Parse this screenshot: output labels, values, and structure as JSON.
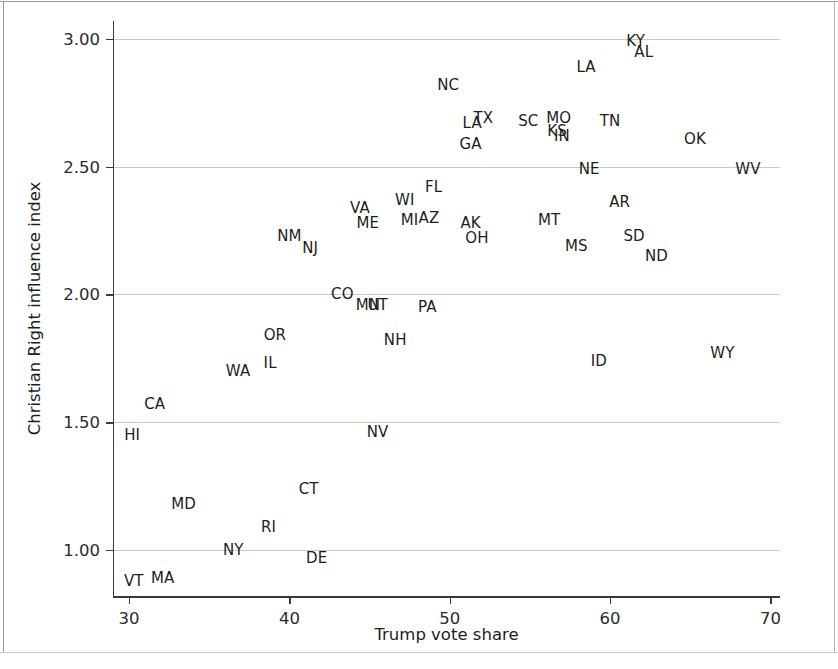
{
  "chart_data": {
    "type": "scatter",
    "title": "",
    "xlabel": "Trump vote share",
    "ylabel": "Christian Right influence index",
    "xlim": [
      29.0,
      70.6
    ],
    "ylim": [
      0.82,
      3.07
    ],
    "xticks": [
      30,
      40,
      50,
      60,
      70
    ],
    "xtick_labels": [
      "30",
      "40",
      "50",
      "60",
      "70"
    ],
    "yticks": [
      1.0,
      1.5,
      2.0,
      2.5,
      3.0
    ],
    "ytick_labels": [
      "1.00",
      "1.50",
      "2.00",
      "2.50",
      "3.00"
    ],
    "grid": "horizontal",
    "legend": "none",
    "marker": "text-label",
    "point_label_field": "state",
    "points": [
      {
        "state": "KY",
        "x": 61.6,
        "y": 2.99
      },
      {
        "state": "AL",
        "x": 62.1,
        "y": 2.95
      },
      {
        "state": "LA",
        "x": 58.5,
        "y": 2.89
      },
      {
        "state": "NC",
        "x": 49.9,
        "y": 2.82
      },
      {
        "state": "LA",
        "x": 51.4,
        "y": 2.67
      },
      {
        "state": "TX",
        "x": 52.1,
        "y": 2.69
      },
      {
        "state": "SC",
        "x": 54.9,
        "y": 2.68
      },
      {
        "state": "MO",
        "x": 56.8,
        "y": 2.69
      },
      {
        "state": "TN",
        "x": 60.0,
        "y": 2.68
      },
      {
        "state": "KS",
        "x": 56.7,
        "y": 2.64
      },
      {
        "state": "IN",
        "x": 57.0,
        "y": 2.62
      },
      {
        "state": "GA",
        "x": 51.3,
        "y": 2.59
      },
      {
        "state": "OK",
        "x": 65.3,
        "y": 2.61
      },
      {
        "state": "NE",
        "x": 58.7,
        "y": 2.49
      },
      {
        "state": "WV",
        "x": 68.6,
        "y": 2.49
      },
      {
        "state": "FL",
        "x": 49.0,
        "y": 2.42
      },
      {
        "state": "WI",
        "x": 47.2,
        "y": 2.37
      },
      {
        "state": "VA",
        "x": 44.4,
        "y": 2.34
      },
      {
        "state": "AR",
        "x": 60.6,
        "y": 2.36
      },
      {
        "state": "ME",
        "x": 44.9,
        "y": 2.28
      },
      {
        "state": "MI",
        "x": 47.5,
        "y": 2.29
      },
      {
        "state": "AZ",
        "x": 48.7,
        "y": 2.3
      },
      {
        "state": "AK",
        "x": 51.3,
        "y": 2.28
      },
      {
        "state": "MT",
        "x": 56.2,
        "y": 2.29
      },
      {
        "state": "OH",
        "x": 51.7,
        "y": 2.22
      },
      {
        "state": "SD",
        "x": 61.5,
        "y": 2.23
      },
      {
        "state": "NM",
        "x": 40.0,
        "y": 2.23
      },
      {
        "state": "MS",
        "x": 57.9,
        "y": 2.19
      },
      {
        "state": "NJ",
        "x": 41.3,
        "y": 2.18
      },
      {
        "state": "ND",
        "x": 62.9,
        "y": 2.15
      },
      {
        "state": "CO",
        "x": 43.3,
        "y": 2.0
      },
      {
        "state": "MN",
        "x": 44.9,
        "y": 1.96
      },
      {
        "state": "UT",
        "x": 45.5,
        "y": 1.96
      },
      {
        "state": "PA",
        "x": 48.6,
        "y": 1.95
      },
      {
        "state": "OR",
        "x": 39.1,
        "y": 1.84
      },
      {
        "state": "NH",
        "x": 46.6,
        "y": 1.82
      },
      {
        "state": "IL",
        "x": 38.8,
        "y": 1.73
      },
      {
        "state": "ID",
        "x": 59.3,
        "y": 1.74
      },
      {
        "state": "WY",
        "x": 67.0,
        "y": 1.77
      },
      {
        "state": "WA",
        "x": 36.8,
        "y": 1.7
      },
      {
        "state": "CA",
        "x": 31.6,
        "y": 1.57
      },
      {
        "state": "HI",
        "x": 30.2,
        "y": 1.45
      },
      {
        "state": "NV",
        "x": 45.5,
        "y": 1.46
      },
      {
        "state": "CT",
        "x": 41.2,
        "y": 1.24
      },
      {
        "state": "MD",
        "x": 33.4,
        "y": 1.18
      },
      {
        "state": "RI",
        "x": 38.7,
        "y": 1.09
      },
      {
        "state": "NY",
        "x": 36.5,
        "y": 1.0
      },
      {
        "state": "DE",
        "x": 41.7,
        "y": 0.97
      },
      {
        "state": "MA",
        "x": 32.1,
        "y": 0.89
      },
      {
        "state": "VT",
        "x": 30.3,
        "y": 0.88
      }
    ]
  }
}
